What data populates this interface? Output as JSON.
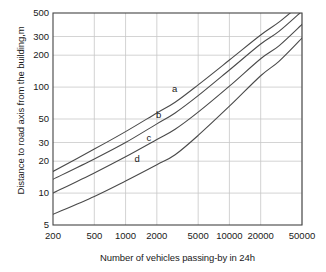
{
  "chart_data": {
    "type": "line",
    "title": "",
    "xlabel": "Number of vehicles passing-by in 24h",
    "ylabel": "Distance to road axis from the building,m",
    "xscale": "log",
    "yscale": "log",
    "xlim": [
      200,
      50000
    ],
    "ylim": [
      5,
      500
    ],
    "grid": true,
    "legend_position": "inline-curve-labels",
    "xticks": [
      200,
      500,
      1000,
      2000,
      5000,
      10000,
      20000,
      50000
    ],
    "xtick_labels": [
      "200",
      "500",
      "1000",
      "2000",
      "5000",
      "10000",
      "20000",
      "50000"
    ],
    "yticks": [
      5,
      10,
      20,
      30,
      50,
      100,
      200,
      300,
      500
    ],
    "ytick_labels": [
      "5",
      "10",
      "20",
      "30",
      "50",
      "100",
      "200",
      "300",
      "500"
    ],
    "series": [
      {
        "name": "a",
        "label": "a",
        "label_x": 3000,
        "label_y": 95,
        "x": [
          200,
          500,
          1000,
          2000,
          3000,
          5000,
          10000,
          20000,
          30000,
          50000
        ],
        "y": [
          16,
          26,
          38,
          57,
          72,
          105,
          180,
          310,
          410,
          620
        ]
      },
      {
        "name": "b",
        "label": "b",
        "label_x": 2100,
        "label_y": 54,
        "x": [
          200,
          500,
          1000,
          2000,
          3000,
          5000,
          10000,
          20000,
          30000,
          50000
        ],
        "y": [
          13.5,
          21,
          30,
          45,
          57,
          83,
          145,
          255,
          335,
          520
        ]
      },
      {
        "name": "c",
        "label": "c",
        "label_x": 1700,
        "label_y": 33,
        "x": [
          200,
          500,
          1000,
          2000,
          3000,
          5000,
          10000,
          20000,
          30000,
          50000
        ],
        "y": [
          10,
          15.5,
          22,
          32,
          40,
          58,
          102,
          185,
          245,
          390
        ]
      },
      {
        "name": "d",
        "label": "d",
        "label_x": 1300,
        "label_y": 21,
        "x": [
          200,
          500,
          1000,
          2000,
          3000,
          5000,
          10000,
          20000,
          30000,
          50000
        ],
        "y": [
          6.3,
          9.3,
          13,
          18.5,
          23,
          35,
          66,
          128,
          175,
          290
        ]
      }
    ],
    "colors": {
      "curve": "#4a4a4a",
      "axis": "#444444",
      "grid": "#c8c8c8",
      "text": "#1a1a1a",
      "background": "#ffffff"
    }
  }
}
